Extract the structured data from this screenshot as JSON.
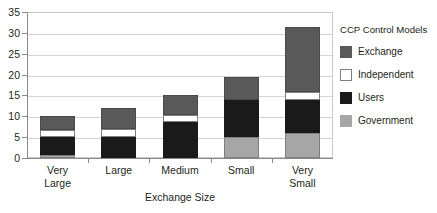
{
  "chart_data": {
    "type": "bar",
    "subtype": "stacked-bar",
    "title": "",
    "xlabel": "Exchange Size",
    "ylabel": "",
    "ylim": [
      0,
      35
    ],
    "yticks": [
      0,
      5,
      10,
      15,
      20,
      25,
      30,
      35
    ],
    "grid": true,
    "legend_position": "right",
    "legend_title": "CCP Control Models",
    "categories": [
      "Very Large",
      "Large",
      "Medium",
      "Small",
      "Very Small"
    ],
    "category_lines": [
      [
        "Very",
        "Large"
      ],
      [
        "Large"
      ],
      [
        "Medium"
      ],
      [
        "Small"
      ],
      [
        "Very",
        "Small"
      ]
    ],
    "stack_order": [
      "Government",
      "Users",
      "Independent",
      "Exchange"
    ],
    "series": [
      {
        "name": "Government",
        "color": "#a6a6a6",
        "border": "#7f7f7f",
        "values": [
          0.8,
          0,
          0,
          5,
          6
        ]
      },
      {
        "name": "Users",
        "color": "#1a1a1a",
        "border": "#1a1a1a",
        "values": [
          4.2,
          5,
          8.7,
          9,
          8
        ]
      },
      {
        "name": "Independent",
        "color": "#ffffff",
        "border": "#7f7f7f",
        "values": [
          1.8,
          1.9,
          1.6,
          0,
          1.8
        ]
      },
      {
        "name": "Exchange",
        "color": "#595959",
        "border": "#4a4a4a",
        "values": [
          3.2,
          5,
          4.7,
          5.4,
          15.7
        ]
      }
    ],
    "totals": [
      10,
      11.9,
      15,
      19.4,
      31.5
    ]
  },
  "legend": {
    "title": "CCP Control Models",
    "items": [
      {
        "label": "Exchange",
        "color": "#595959"
      },
      {
        "label": "Independent",
        "color": "#ffffff"
      },
      {
        "label": "Users",
        "color": "#1a1a1a"
      },
      {
        "label": "Government",
        "color": "#a6a6a6"
      }
    ]
  },
  "axes": {
    "x_title": "Exchange Size",
    "y_tick_labels": [
      "35",
      "30",
      "25",
      "20",
      "15",
      "10",
      "5",
      "0"
    ]
  },
  "footer": {
    "text": ""
  }
}
